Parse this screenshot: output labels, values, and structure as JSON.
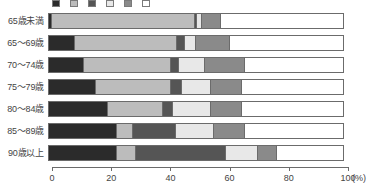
{
  "axis": {
    "unit_label": "(%)",
    "ticks": [
      0,
      20,
      40,
      60,
      80,
      100
    ],
    "tick_labels": [
      "0",
      "20",
      "40",
      "60",
      "80",
      "100"
    ]
  },
  "legend": {
    "visible_note": "legend row is cropped at the very top edge of the screenshot",
    "items": [
      {
        "label": "",
        "color": "#2b2b2b"
      },
      {
        "label": "",
        "color": "#bcbcbc"
      },
      {
        "label": "",
        "color": "#555555"
      },
      {
        "label": "",
        "color": "#e8e8e8"
      },
      {
        "label": "",
        "color": "#8a8a8a"
      },
      {
        "label": "",
        "color": "#ffffff"
      }
    ]
  },
  "colors": {
    "s1": "#2b2b2b",
    "s2": "#bcbcbc",
    "s3": "#555555",
    "s4": "#e8e8e8",
    "s5": "#8a8a8a",
    "s6": "#ffffff",
    "outline": "#6b6b6b",
    "text": "#444444"
  },
  "chart_data": {
    "type": "bar",
    "orientation": "horizontal",
    "stacked": true,
    "normalized": true,
    "title": "",
    "subtitle": "",
    "xlabel": "(%)",
    "ylabel": "",
    "xlim": [
      0,
      100
    ],
    "grid": false,
    "legend_position": "top",
    "categories": [
      "65歳未満",
      "65～69歳",
      "70～74歳",
      "75～79歳",
      "80～84歳",
      "85～89歳",
      "90歳以上"
    ],
    "series": [
      {
        "name": "s1",
        "color": "#2b2b2b",
        "values": [
          1,
          9,
          12,
          16,
          20,
          23,
          23
        ]
      },
      {
        "name": "s2",
        "color": "#bcbcbc",
        "values": [
          49,
          35,
          30,
          26,
          19,
          6,
          7
        ]
      },
      {
        "name": "s3",
        "color": "#555555",
        "values": [
          1,
          3,
          3,
          4,
          4,
          15,
          31
        ]
      },
      {
        "name": "s4",
        "color": "#e8e8e8",
        "values": [
          2,
          4,
          9,
          10,
          13,
          13,
          11
        ]
      },
      {
        "name": "s5",
        "color": "#8a8a8a",
        "values": [
          7,
          12,
          14,
          11,
          11,
          11,
          7
        ]
      },
      {
        "name": "s6",
        "color": "#ffffff",
        "values": [
          40,
          37,
          32,
          33,
          33,
          32,
          21
        ]
      }
    ]
  }
}
